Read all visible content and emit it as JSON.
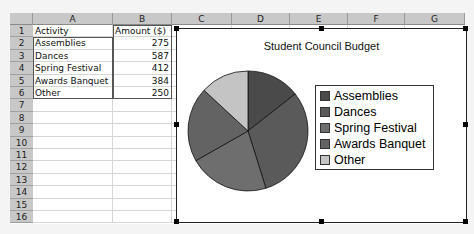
{
  "columns": [
    "A",
    "B",
    "C",
    "D",
    "E",
    "F",
    "G"
  ],
  "rows": [
    "1",
    "2",
    "3",
    "4",
    "5",
    "6",
    "7",
    "8",
    "9",
    "10",
    "11",
    "12",
    "13",
    "14",
    "15",
    "16"
  ],
  "table": {
    "header": [
      "Activity",
      "Amount ($)"
    ],
    "data": [
      [
        "Assemblies",
        "275"
      ],
      [
        "Dances",
        "587"
      ],
      [
        "Spring Festival",
        "412"
      ],
      [
        "Awards Banquet",
        "384"
      ],
      [
        "Other",
        "250"
      ]
    ]
  },
  "chart_data": {
    "type": "pie",
    "title": "Student Council Budget",
    "categories": [
      "Assemblies",
      "Dances",
      "Spring Festival",
      "Awards Banquet",
      "Other"
    ],
    "values": [
      275,
      587,
      412,
      384,
      250
    ],
    "colors": [
      "#4a4a4a",
      "#5a5a5a",
      "#6e6e6e",
      "#636363",
      "#c4c4c4"
    ],
    "legend_position": "right"
  }
}
